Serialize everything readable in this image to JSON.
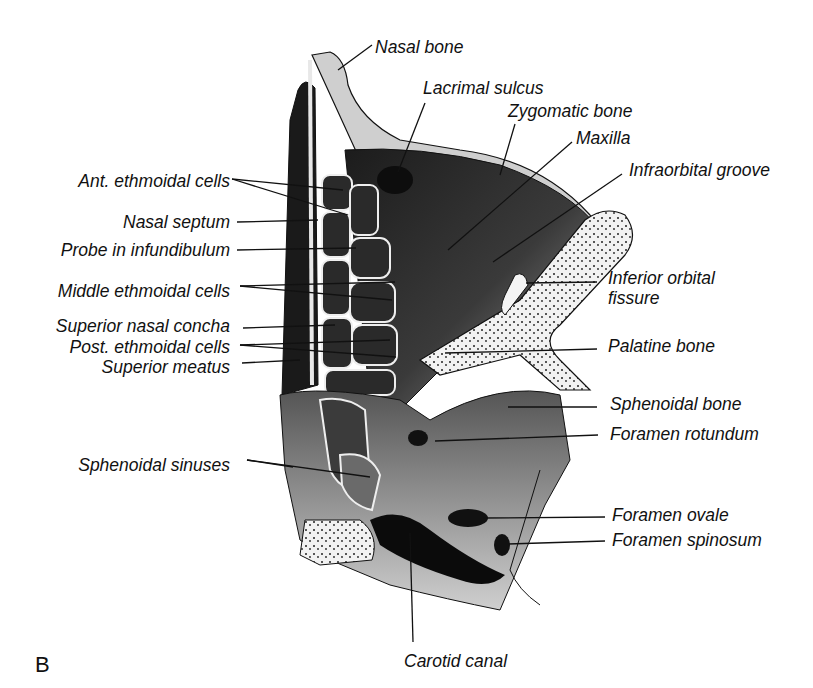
{
  "figure": {
    "panel_letter": "B",
    "colors": {
      "ink": "#111111",
      "bone_light": "#e8e8e8",
      "cavity_dark": "#1a1a1a",
      "mid_gray": "#6b6b6b"
    }
  },
  "labels": [
    {
      "id": "nasal-bone",
      "text": "Nasal bone",
      "x": 375,
      "y": 37,
      "align": "left",
      "leaders": [
        [
          372,
          45,
          338,
          70
        ]
      ]
    },
    {
      "id": "lacrimal-sulcus",
      "text": "Lacrimal sulcus",
      "x": 423,
      "y": 78,
      "align": "left",
      "leaders": [
        [
          425,
          103,
          398,
          172
        ]
      ]
    },
    {
      "id": "zygomatic-bone",
      "text": "Zygomatic bone",
      "x": 508,
      "y": 101,
      "align": "left",
      "leaders": [
        [
          515,
          124,
          500,
          175
        ]
      ]
    },
    {
      "id": "maxilla",
      "text": "Maxilla",
      "x": 576,
      "y": 128,
      "align": "left",
      "leaders": [
        [
          572,
          142,
          448,
          250
        ]
      ]
    },
    {
      "id": "infraorbital-groove",
      "text": "Infraorbital groove",
      "x": 629,
      "y": 160,
      "align": "left",
      "leaders": [
        [
          622,
          174,
          493,
          262
        ]
      ]
    },
    {
      "id": "ant-ethmoidal-cells",
      "text": "Ant. ethmoidal cells",
      "x": 230,
      "y": 171,
      "align": "right",
      "leaders": [
        [
          232,
          179,
          343,
          190
        ],
        [
          232,
          179,
          348,
          215
        ]
      ]
    },
    {
      "id": "nasal-septum",
      "text": "Nasal septum",
      "x": 230,
      "y": 212,
      "align": "right",
      "leaders": [
        [
          237,
          222,
          318,
          220
        ]
      ]
    },
    {
      "id": "probe-infundibulum",
      "text": "Probe in infundibulum",
      "x": 230,
      "y": 240,
      "align": "right",
      "leaders": [
        [
          237,
          250,
          356,
          248
        ]
      ]
    },
    {
      "id": "inferior-orbital-fissure",
      "text": "Inferior orbital fissure",
      "x": 608,
      "y": 268,
      "align": "left",
      "wrap": [
        "Inferior orbital",
        "fissure"
      ],
      "leaders": [
        [
          597,
          282,
          526,
          283
        ]
      ]
    },
    {
      "id": "middle-ethmoidal-cells",
      "text": "Middle ethmoidal cells",
      "x": 230,
      "y": 281,
      "align": "right",
      "leaders": [
        [
          240,
          286,
          395,
          282
        ],
        [
          240,
          286,
          392,
          300
        ]
      ]
    },
    {
      "id": "superior-nasal-concha",
      "text": "Superior nasal concha",
      "x": 230,
      "y": 316,
      "align": "right",
      "leaders": [
        [
          243,
          328,
          335,
          325
        ]
      ]
    },
    {
      "id": "post-ethmoidal-cells",
      "text": "Post. ethmoidal cells",
      "x": 230,
      "y": 337,
      "align": "right",
      "leaders": [
        [
          240,
          345,
          390,
          340
        ],
        [
          240,
          345,
          396,
          357
        ]
      ]
    },
    {
      "id": "palatine-bone",
      "text": "Palatine bone",
      "x": 608,
      "y": 336,
      "align": "left",
      "leaders": [
        [
          597,
          349,
          445,
          353
        ]
      ]
    },
    {
      "id": "superior-meatus",
      "text": "Superior meatus",
      "x": 230,
      "y": 357,
      "align": "right",
      "leaders": [
        [
          242,
          363,
          300,
          360
        ]
      ]
    },
    {
      "id": "sphenoidal-bone",
      "text": "Sphenoidal bone",
      "x": 610,
      "y": 394,
      "align": "left",
      "leaders": [
        [
          597,
          407,
          508,
          407
        ]
      ]
    },
    {
      "id": "foramen-rotundum",
      "text": "Foramen rotundum",
      "x": 610,
      "y": 424,
      "align": "left",
      "leaders": [
        [
          598,
          435,
          435,
          441
        ]
      ]
    },
    {
      "id": "sphenoidal-sinuses",
      "text": "Sphenoidal sinuses",
      "x": 230,
      "y": 455,
      "align": "right",
      "leaders": [
        [
          247,
          460,
          293,
          467
        ],
        [
          247,
          460,
          370,
          477
        ]
      ]
    },
    {
      "id": "foramen-ovale",
      "text": "Foramen ovale",
      "x": 612,
      "y": 505,
      "align": "left",
      "leaders": [
        [
          605,
          517,
          483,
          518
        ]
      ]
    },
    {
      "id": "foramen-spinosum",
      "text": "Foramen spinosum",
      "x": 612,
      "y": 530,
      "align": "left",
      "leaders": [
        [
          605,
          541,
          508,
          544
        ]
      ]
    },
    {
      "id": "carotid-canal",
      "text": "Carotid canal",
      "x": 404,
      "y": 651,
      "align": "left",
      "leaders": [
        [
          413,
          642,
          410,
          533
        ]
      ]
    }
  ]
}
